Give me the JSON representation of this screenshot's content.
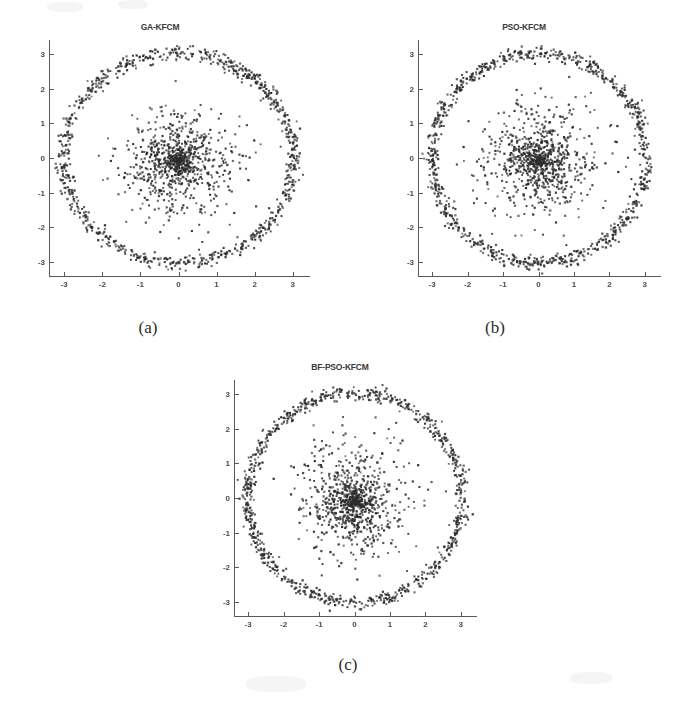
{
  "figure": {
    "background_color": "#ffffff",
    "point_color": "#2e2e2e",
    "axis_color": "#585858",
    "panels": [
      {
        "id": "panel-a",
        "title": "GA-KFCM",
        "caption": "(a)",
        "seed": 11
      },
      {
        "id": "panel-b",
        "title": "PSO-KFCM",
        "caption": "(b)",
        "seed": 29
      },
      {
        "id": "panel-c",
        "title": "BF-PSO-KFCM",
        "caption": "(c)",
        "seed": 47
      }
    ]
  },
  "chart_data": [
    {
      "type": "scatter",
      "title": "GA-KFCM",
      "caption": "(a)",
      "xlabel": "",
      "ylabel": "",
      "xlim": [
        -3.4,
        3.4
      ],
      "ylim": [
        -3.4,
        3.4
      ],
      "xticks": [
        -3,
        -2,
        -1,
        0,
        1,
        2,
        3
      ],
      "yticks": [
        -3,
        -2,
        -1,
        0,
        1,
        2,
        3
      ],
      "xticklabels": [
        "-3",
        "-2",
        "-1",
        "0",
        "1",
        "2",
        "3"
      ],
      "yticklabels": [
        "-3",
        "-2",
        "-1",
        "0",
        "1",
        "2",
        "3"
      ],
      "grid": false,
      "legend": null,
      "marker": "point",
      "marker_color": "#2e2e2e",
      "marker_size": 1.8,
      "series": [
        {
          "name": "ring-cluster",
          "distribution": "annulus",
          "center": [
            0,
            0
          ],
          "radius_mean": 3.02,
          "radius_sd": 0.1,
          "n_points": 900
        },
        {
          "name": "core-cluster",
          "distribution": "gaussian-radial",
          "center": [
            0,
            -0.1
          ],
          "radius_sd": 0.95,
          "radius_max": 2.6,
          "n_points": 900
        }
      ]
    },
    {
      "type": "scatter",
      "title": "PSO-KFCM",
      "caption": "(b)",
      "xlabel": "",
      "ylabel": "",
      "xlim": [
        -3.4,
        3.4
      ],
      "ylim": [
        -3.4,
        3.4
      ],
      "xticks": [
        -3,
        -2,
        -1,
        0,
        1,
        2,
        3
      ],
      "yticks": [
        -3,
        -2,
        -1,
        0,
        1,
        2,
        3
      ],
      "xticklabels": [
        "-3",
        "-2",
        "-1",
        "0",
        "1",
        "2",
        "3"
      ],
      "yticklabels": [
        "-3",
        "-2",
        "-1",
        "0",
        "1",
        "2",
        "3"
      ],
      "grid": false,
      "legend": null,
      "marker": "point",
      "marker_color": "#2e2e2e",
      "marker_size": 1.8,
      "series": [
        {
          "name": "ring-cluster",
          "distribution": "annulus",
          "center": [
            0,
            0
          ],
          "radius_mean": 3.02,
          "radius_sd": 0.1,
          "n_points": 900
        },
        {
          "name": "core-cluster",
          "distribution": "gaussian-radial",
          "center": [
            0,
            -0.1
          ],
          "radius_sd": 0.95,
          "radius_max": 2.6,
          "n_points": 900
        }
      ]
    },
    {
      "type": "scatter",
      "title": "BF-PSO-KFCM",
      "caption": "(c)",
      "xlabel": "",
      "ylabel": "",
      "xlim": [
        -3.4,
        3.4
      ],
      "ylim": [
        -3.4,
        3.4
      ],
      "xticks": [
        -3,
        -2,
        -1,
        0,
        1,
        2,
        3
      ],
      "yticks": [
        -3,
        -2,
        -1,
        0,
        1,
        2,
        3
      ],
      "xticklabels": [
        "-3",
        "-2",
        "-1",
        "0",
        "1",
        "2",
        "3"
      ],
      "yticklabels": [
        "-3",
        "-2",
        "-1",
        "0",
        "1",
        "2",
        "3"
      ],
      "grid": false,
      "legend": null,
      "marker": "point",
      "marker_color": "#2e2e2e",
      "marker_size": 1.8,
      "series": [
        {
          "name": "ring-cluster",
          "distribution": "annulus",
          "center": [
            0,
            0
          ],
          "radius_mean": 3.02,
          "radius_sd": 0.1,
          "n_points": 900
        },
        {
          "name": "core-cluster",
          "distribution": "gaussian-radial",
          "center": [
            0,
            -0.1
          ],
          "radius_sd": 0.95,
          "radius_max": 2.6,
          "n_points": 900
        }
      ]
    }
  ]
}
